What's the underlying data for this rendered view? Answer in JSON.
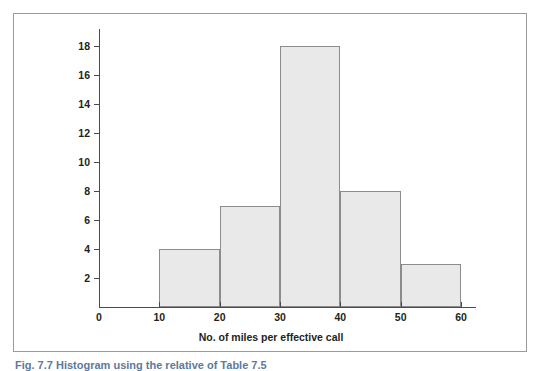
{
  "figure": {
    "caption": "Fig. 7.7  Histogram using the relative of Table 7.5",
    "frame_color": "#9a9a9a",
    "axis_color": "#4a4a4a",
    "bar_fill": "#e9e9e9",
    "bar_stroke": "#8c8c8c",
    "caption_color": "#5c7a9c"
  },
  "chart_data": {
    "type": "bar",
    "title": "",
    "subtitle": "",
    "xlabel": "No. of miles per effective call",
    "ylabel": "",
    "categories": [
      "10-20",
      "20-30",
      "30-40",
      "40-50",
      "50-60"
    ],
    "bin_edges": [
      10,
      20,
      30,
      40,
      50,
      60
    ],
    "values": [
      4,
      7,
      18,
      8,
      3
    ],
    "bars": [
      {
        "label": "10-20",
        "start": 10,
        "end": 20,
        "value": 4
      },
      {
        "label": "20-30",
        "start": 20,
        "end": 30,
        "value": 7
      },
      {
        "label": "30-40",
        "start": 30,
        "end": 40,
        "value": 18
      },
      {
        "label": "40-50",
        "start": 40,
        "end": 50,
        "value": 8
      },
      {
        "label": "50-60",
        "start": 50,
        "end": 60,
        "value": 3
      }
    ],
    "xlim": [
      0,
      60
    ],
    "ylim": [
      0,
      18
    ],
    "xticks": [
      0,
      10,
      20,
      30,
      40,
      50,
      60
    ],
    "xtick_labels": [
      "0",
      "10",
      "20",
      "30",
      "40",
      "50",
      "60"
    ],
    "yticks": [
      2,
      4,
      6,
      8,
      10,
      12,
      14,
      16,
      18
    ],
    "ytick_labels": [
      "2",
      "4",
      "6",
      "8",
      "10",
      "12",
      "14",
      "16",
      "18"
    ],
    "grid": false,
    "legend": null,
    "legend_position": "none",
    "annotations": []
  }
}
